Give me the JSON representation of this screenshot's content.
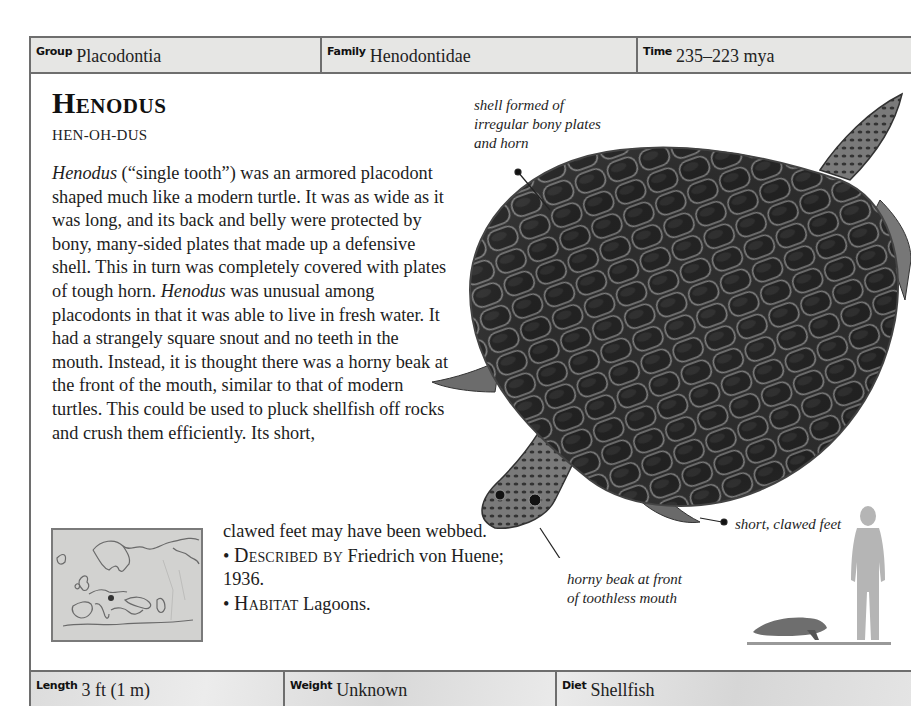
{
  "header": {
    "cells": [
      {
        "label": "Group",
        "value": "Placodontia"
      },
      {
        "label": "Family",
        "value": "Henodontidae"
      },
      {
        "label": "Time",
        "value": "235–223 mya"
      }
    ]
  },
  "entry": {
    "title": "Henodus",
    "pronunciation": "HEN-OH-DUS",
    "body": {
      "italic_name": "Henodus",
      "p1": " (“single tooth”) was an armored placodont shaped much like a modern turtle. It was as wide as it was long, and its back and belly were protected by bony, many-sided plates that made up a defensive shell. This in turn was completely covered with plates of tough horn. ",
      "italic_name_2": "Henodus",
      "p2": " was unusual among placodonts in that it was able to live in fresh water. It had a strangely square snout and no teeth in the mouth. Instead, it is thought there was a horny beak at the front of the mouth, similar to that of modern turtles. This could be used to pluck shellfish off rocks and crush them efficiently. Its short,",
      "p3": "clawed feet may have been webbed."
    },
    "facts": [
      {
        "bullet": "•",
        "key": "Described by",
        "value": "Friedrich von Huene; 1936."
      },
      {
        "bullet": "•",
        "key": "Habitat",
        "value": "Lagoons."
      }
    ]
  },
  "illustration": {
    "callouts": {
      "shell": "shell formed of irregular bony plates and horn",
      "feet": "short, clawed feet",
      "beak": "horny beak at front of toothless mouth"
    }
  },
  "map": {
    "region": "Europe",
    "marker": "fossil-location-dot"
  },
  "scale": {
    "human": "human-silhouette",
    "animal": "henodus-silhouette"
  },
  "footer": {
    "cells": [
      {
        "label": "Length",
        "value": "3 ft (1 m)"
      },
      {
        "label": "Weight",
        "value": "Unknown"
      },
      {
        "label": "Diet",
        "value": "Shellfish"
      }
    ]
  },
  "colors": {
    "strip_bg": "#e6e6e4",
    "border": "#6e6e6e",
    "text": "#1d1d1d",
    "silhouette": "#b5b5b5"
  }
}
